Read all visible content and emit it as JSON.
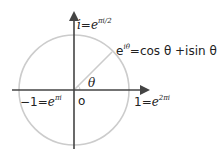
{
  "diagram": {
    "labels": {
      "top": {
        "lhs": "i",
        "eq": "=",
        "base": "e",
        "exp": "πi/2"
      },
      "euler": {
        "base": "e",
        "exp": "iθ",
        "rhs": "=cos θ +isin θ"
      },
      "angle": "θ",
      "origin": "o",
      "left": {
        "lhs": "−1",
        "eq": "=",
        "base": "e",
        "exp": "πi"
      },
      "right": {
        "lhs": "1",
        "eq": "=",
        "base": "e",
        "exp": "2πi"
      }
    },
    "colors": {
      "circle": "#cccccc",
      "axes": "#444444",
      "text": "#222222"
    }
  }
}
